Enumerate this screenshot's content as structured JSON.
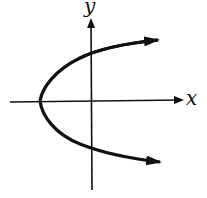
{
  "diagram": {
    "title": "",
    "type": "graph of sideways parabola opening right",
    "axes": {
      "x_label": "x",
      "y_label": "y"
    },
    "curve": {
      "description": "parabola x = ay^2 + c with vertex left of origin, opening right, both arms with arrowheads",
      "vertex": [
        40,
        101
      ],
      "upper_arrow_tip": [
        162,
        40
      ],
      "lower_arrow_tip": [
        163,
        163
      ]
    },
    "colors": {
      "stroke": "#111111",
      "background": "#ffffff"
    }
  }
}
